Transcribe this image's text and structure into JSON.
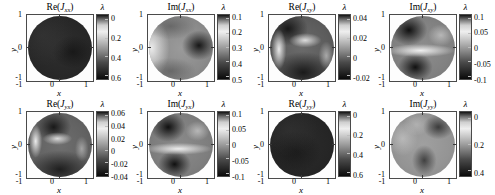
{
  "figure": {
    "colorbar_symbol": "λ",
    "axis": {
      "xlabel": "x",
      "ylabel": "y",
      "xticks": [
        "-1",
        "0",
        "1"
      ],
      "yticks": [
        "-1",
        "0",
        "1"
      ],
      "xlim": [
        -1,
        1
      ],
      "ylim": [
        -1,
        1
      ]
    }
  },
  "chart_data": {
    "type": "heatmap",
    "title": "",
    "layout": "2 rows x 4 columns of circular-aperture heatmaps",
    "colormap": "grayscale",
    "grid": false,
    "legend": "per-panel vertical colorbar labeled lambda",
    "shared_axes": {
      "xlabel": "x",
      "ylabel": "y",
      "xticks": [
        "-1",
        "0",
        "1"
      ],
      "yticks": [
        "-1",
        "0",
        "1"
      ],
      "xlim": [
        -1,
        1
      ],
      "ylim": [
        -1,
        1
      ],
      "domain": "unit disc x^2 + y^2 <= 1"
    },
    "panels": [
      {
        "index": 0,
        "row": 0,
        "col": 0,
        "title_function": "Re",
        "title_symbol": "J",
        "title_subscript": "xx",
        "title": "Re(Jxx)",
        "cbar_label": "λ",
        "cbar_ticks": [
          "0",
          "0.2",
          "0.4",
          "0.6"
        ],
        "cbar_tick_values": [
          0,
          0.2,
          0.4,
          0.6
        ],
        "zrange": [
          -0.05,
          0.72
        ],
        "description": "nearly uniform dark disc, value close to 0 across aperture"
      },
      {
        "index": 1,
        "row": 0,
        "col": 1,
        "title_function": "Im",
        "title_symbol": "J",
        "title_subscript": "xx",
        "title": "Im(Jxx)",
        "cbar_label": "λ",
        "cbar_ticks": [
          "0.1",
          "0.2",
          "0.3",
          "0.4",
          "0.5"
        ],
        "cbar_tick_values": [
          0.1,
          0.2,
          0.3,
          0.4,
          0.5
        ],
        "zrange": [
          0.02,
          0.55
        ],
        "description": "bright crescent on left rim, dark lobe right of centre"
      },
      {
        "index": 2,
        "row": 0,
        "col": 2,
        "title_function": "Re",
        "title_symbol": "J",
        "title_subscript": "xy",
        "title": "Re(Jxy)",
        "cbar_label": "λ",
        "cbar_ticks": [
          "0.04",
          "0.02",
          "0",
          "-0.02"
        ],
        "cbar_tick_values": [
          0.04,
          0.02,
          0,
          -0.02
        ],
        "zrange": [
          -0.035,
          0.05
        ],
        "description": "S-shaped bright band dividing dark upper-left and dark lower region"
      },
      {
        "index": 3,
        "row": 0,
        "col": 3,
        "title_function": "Im",
        "title_symbol": "J",
        "title_subscript": "xy",
        "title": "Im(Jxy)",
        "cbar_label": "λ",
        "cbar_ticks": [
          "0.1",
          "0.05",
          "0",
          "-0.05",
          "-0.1"
        ],
        "cbar_tick_values": [
          0.1,
          0.05,
          0,
          -0.05,
          -0.1
        ],
        "zrange": [
          -0.12,
          0.12
        ],
        "description": "two dark lobes upper-left and lower-centre, bright horizontal band between"
      },
      {
        "index": 4,
        "row": 1,
        "col": 0,
        "title_function": "Re",
        "title_symbol": "J",
        "title_subscript": "yx",
        "title": "Re(Jyx)",
        "cbar_label": "λ",
        "cbar_ticks": [
          "0.06",
          "0.04",
          "0.02",
          "0",
          "-0.02",
          "-0.04"
        ],
        "cbar_tick_values": [
          0.06,
          0.04,
          0.02,
          0,
          -0.02,
          -0.04
        ],
        "zrange": [
          -0.05,
          0.07
        ],
        "description": "bright ring arc upper-left enclosing dark lobe, dark lower half"
      },
      {
        "index": 5,
        "row": 1,
        "col": 1,
        "title_function": "Im",
        "title_symbol": "J",
        "title_subscript": "yx",
        "title": "Im(Jyx)",
        "cbar_label": "λ",
        "cbar_ticks": [
          "0.1",
          "0.05",
          "0",
          "-0.05",
          "-0.1"
        ],
        "cbar_tick_values": [
          0.1,
          0.05,
          0,
          -0.05,
          -0.1
        ],
        "zrange": [
          -0.12,
          0.12
        ],
        "description": "dark lobe upper-left and dark lobe lower-centre, bright band separating"
      },
      {
        "index": 6,
        "row": 1,
        "col": 2,
        "title_function": "Re",
        "title_symbol": "J",
        "title_subscript": "yy",
        "title": "Re(Jyy)",
        "cbar_label": "λ",
        "cbar_ticks": [
          "0",
          "0.2",
          "0.4",
          "0.6"
        ],
        "cbar_tick_values": [
          0,
          0.2,
          0.4,
          0.6
        ],
        "zrange": [
          -0.05,
          0.7
        ],
        "description": "nearly uniform dark disc, value close to 0 across aperture"
      },
      {
        "index": 7,
        "row": 1,
        "col": 3,
        "title_function": "Im",
        "title_symbol": "J",
        "title_subscript": "yy",
        "title": "Im(Jyy)",
        "cbar_label": "λ",
        "cbar_ticks": [
          "0",
          "0.2",
          "0.4"
        ],
        "cbar_tick_values": [
          0,
          0.2,
          0.4
        ],
        "zrange": [
          0.02,
          0.5
        ],
        "description": "brighter mid-grey disc with darker patches upper-right and lower-centre"
      }
    ]
  }
}
